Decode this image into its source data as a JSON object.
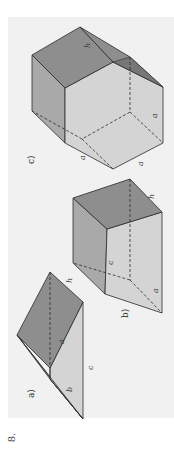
{
  "figure": {
    "number": "8.",
    "orientation": "rotated 90° counter-clockwise",
    "panels": [
      {
        "id": "a",
        "label": "a)",
        "shape": "triangular prism",
        "edge_labels": [
          "a",
          "b",
          "c",
          "h"
        ]
      },
      {
        "id": "b",
        "label": "b)",
        "shape": "quadrilateral prism (cube-like)",
        "edge_labels": [
          "a",
          "c",
          "h"
        ]
      },
      {
        "id": "c",
        "label": "c)",
        "shape": "pentagonal prism",
        "edge_labels": [
          "a",
          "a",
          "a",
          "h"
        ]
      }
    ]
  },
  "colors": {
    "panel_bg": "#f1f1f1",
    "top_face": "#8e8e8e",
    "side_dark": "#a9a9a9",
    "side_light": "#d4d4d4",
    "edge": "#2b2b2b"
  },
  "labels": {
    "a": "a",
    "b": "b",
    "c": "c",
    "h": "h",
    "panel_a": "a)",
    "panel_b": "b)",
    "panel_c": "c)"
  }
}
